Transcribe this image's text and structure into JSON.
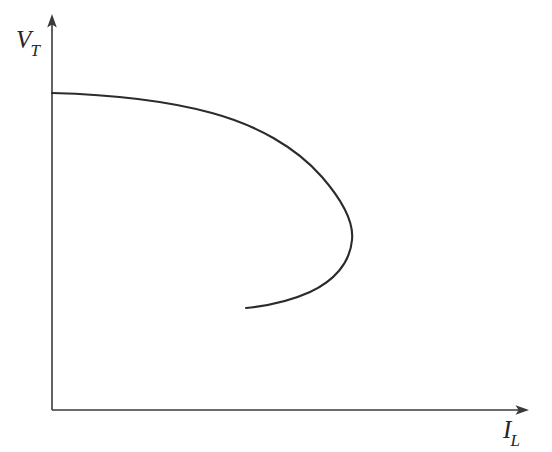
{
  "figure": {
    "background_color": "#ffffff",
    "line_color": "#2b2b2b",
    "axis_color": "#3a3a3a",
    "label_color": "#262626"
  },
  "axes": {
    "y": {
      "symbol": "V",
      "subscript": "T",
      "label_text": "V_T",
      "name": "terminal-voltage",
      "arrow": "up",
      "origin_px": [
        52,
        410
      ],
      "tip_px": [
        52,
        16
      ]
    },
    "x": {
      "symbol": "I",
      "subscript": "L",
      "label_text": "I_L",
      "name": "load-current",
      "arrow": "right",
      "origin_px": [
        52,
        410
      ],
      "tip_px": [
        528,
        410
      ]
    }
  },
  "chart_data": {
    "type": "line",
    "title": "",
    "subtitle": "",
    "xlabel": "I_L",
    "ylabel": "V_T",
    "grid": false,
    "legend": null,
    "axis_ticks": {
      "x": [],
      "y": []
    },
    "xlim": [
      0,
      1
    ],
    "ylim": [
      0,
      1
    ],
    "series": [
      {
        "name": "nose-curve",
        "color": "#2b2b2b",
        "width_px": 2.1,
        "closed": false,
        "points_px": [
          [
            52,
            93
          ],
          [
            80,
            94
          ],
          [
            110,
            97
          ],
          [
            140,
            100
          ],
          [
            170,
            104
          ],
          [
            200,
            110
          ],
          [
            230,
            119
          ],
          [
            255,
            129
          ],
          [
            280,
            142
          ],
          [
            300,
            156
          ],
          [
            318,
            172
          ],
          [
            332,
            189
          ],
          [
            342,
            205
          ],
          [
            349,
            221
          ],
          [
            352,
            234
          ],
          [
            351,
            248
          ],
          [
            346,
            262
          ],
          [
            338,
            273
          ],
          [
            327,
            283
          ],
          [
            313,
            291
          ],
          [
            297,
            298
          ],
          [
            280,
            303
          ],
          [
            264,
            306
          ],
          [
            246,
            308
          ]
        ],
        "path_d": "M 52 93 C 110 94.5 168 101 212 113 C 256 125 296 147 322 177 C 342 200 354 221 352 240 C 350 263 334 281 310 292 C 288 302 266 306 246 308"
      }
    ]
  }
}
